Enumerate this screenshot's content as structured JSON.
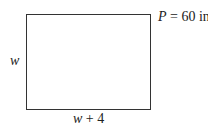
{
  "diagram": {
    "shape": "rectangle",
    "perimeter": {
      "var": "P",
      "eq": " = 60 in"
    },
    "side_label": {
      "var": "w"
    },
    "bottom_label": {
      "var": "w",
      "rest": " + 4"
    }
  }
}
